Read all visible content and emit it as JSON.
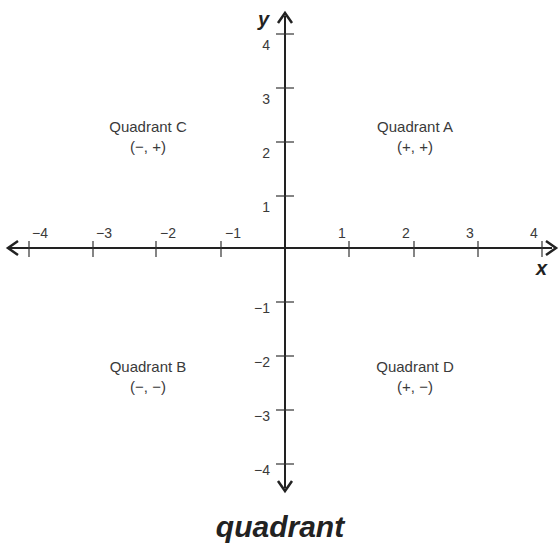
{
  "diagram": {
    "type": "coordinate-plane",
    "x_axis": {
      "name": "x",
      "ticks": [
        "−4",
        "−3",
        "−2",
        "−1",
        "1",
        "2",
        "3",
        "4"
      ]
    },
    "y_axis": {
      "name": "y",
      "ticks_positive": [
        "4",
        "3",
        "2",
        "1"
      ],
      "ticks_negative": [
        "−1",
        "−2",
        "−3",
        "−4"
      ]
    },
    "quadrants": [
      {
        "name": "Quadrant C",
        "signs": "(−, +)"
      },
      {
        "name": "Quadrant A",
        "signs": "(+, +)"
      },
      {
        "name": "Quadrant B",
        "signs": "(−, −)"
      },
      {
        "name": "Quadrant D",
        "signs": "(+, −)"
      }
    ],
    "caption": "quadrant",
    "colors": {
      "axis": "#222222",
      "text": "#3a3a3a",
      "background": "#ffffff"
    }
  }
}
